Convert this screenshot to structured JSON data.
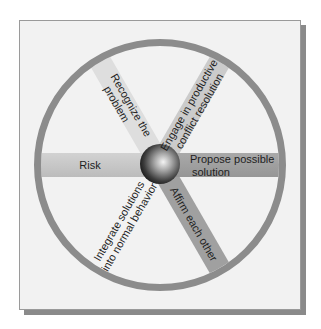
{
  "diagram": {
    "type": "wheel",
    "center_label": "",
    "spokes": [
      {
        "id": "risk",
        "lines": [
          "Risk"
        ],
        "angle_deg": 180,
        "color": "#c6c6c6"
      },
      {
        "id": "recognize",
        "lines": [
          "Recognize the",
          "problem"
        ],
        "angle_deg": 120,
        "color": "#dedede"
      },
      {
        "id": "engage",
        "lines": [
          "Engage in productive",
          "conflict resolution"
        ],
        "angle_deg": 60,
        "color": "#cbcbcb"
      },
      {
        "id": "propose",
        "lines": [
          "Propose possible",
          "solution"
        ],
        "angle_deg": 0,
        "color": "#a3a3a3"
      },
      {
        "id": "affirm",
        "lines": [
          "Affirm each other"
        ],
        "angle_deg": -60,
        "color": "#a0a0a0"
      },
      {
        "id": "integrate",
        "lines": [
          "Integrate solutions",
          "into normal behavior"
        ],
        "angle_deg": -120,
        "color": "none"
      }
    ]
  },
  "colors": {
    "card_bg": "#f2f2f2",
    "card_border": "#9a9a9a",
    "shadow": "#8a8a8a",
    "ring": "#8c8c8c",
    "text": "#1e1e1e"
  }
}
